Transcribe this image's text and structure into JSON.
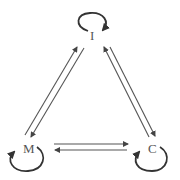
{
  "diagram": {
    "type": "state-transition",
    "nodes": [
      {
        "id": "I",
        "label": "I",
        "position": "top",
        "self_loop": true
      },
      {
        "id": "M",
        "label": "M",
        "position": "bottom-left",
        "self_loop": true
      },
      {
        "id": "C",
        "label": "C",
        "position": "bottom-right",
        "self_loop": true
      }
    ],
    "edges": [
      {
        "from": "M",
        "to": "I"
      },
      {
        "from": "I",
        "to": "M"
      },
      {
        "from": "I",
        "to": "C"
      },
      {
        "from": "C",
        "to": "I"
      },
      {
        "from": "M",
        "to": "C"
      },
      {
        "from": "C",
        "to": "M"
      },
      {
        "from": "I",
        "to": "I"
      },
      {
        "from": "M",
        "to": "M"
      },
      {
        "from": "C",
        "to": "C"
      }
    ],
    "colors": {
      "edge": "#555555",
      "loop": "#333333",
      "label": "#555555",
      "background": "#ffffff"
    }
  }
}
